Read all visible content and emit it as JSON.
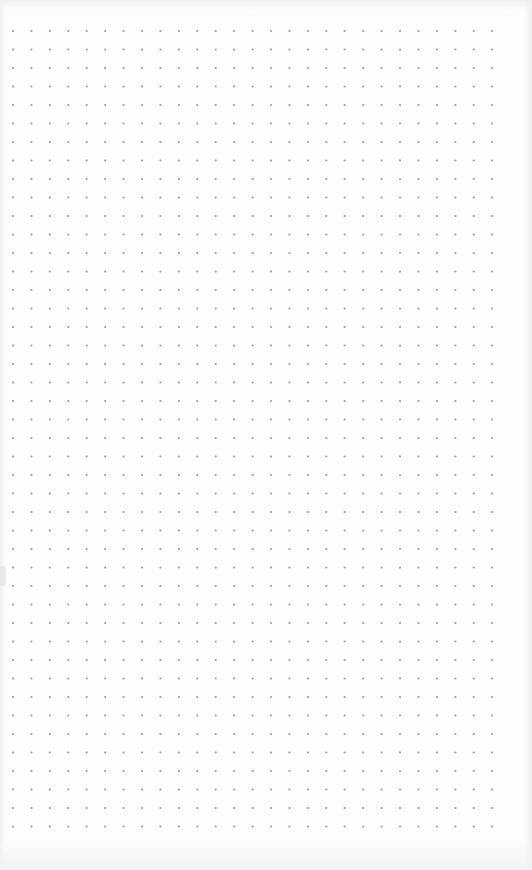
{
  "canvas": {
    "type": "dot-grid-paper",
    "background_color": "#fdfdfd",
    "dot_color": "#9c9c9c",
    "columns": 27,
    "rows": 44,
    "pitch_x": 18.43,
    "pitch_y": 18.5,
    "dot_radius": 1.1
  }
}
